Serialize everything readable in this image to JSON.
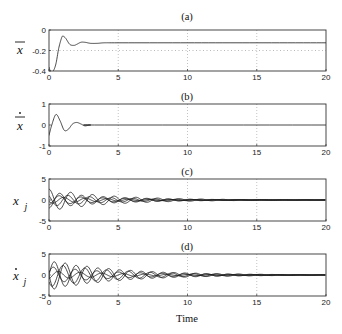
{
  "chart_data": [
    {
      "type": "line",
      "panel": "a",
      "title": "(a)",
      "ylabel": "x̄",
      "xlabel": "",
      "xlim": [
        0,
        20
      ],
      "ylim": [
        -0.4,
        0
      ],
      "xticks": [
        0,
        5,
        10,
        15,
        20
      ],
      "yticks": [
        0,
        -0.2,
        -0.4
      ],
      "ytick_labels": [
        "0",
        "-0.2",
        "-0.4"
      ],
      "grid": "vertical dotted at 5,10,15",
      "reference_line": {
        "y": -0.2,
        "style": "dotted"
      },
      "series": [
        {
          "name": "x_bar",
          "x": [
            0,
            0.1,
            0.3,
            0.5,
            0.7,
            0.9,
            1.0,
            1.2,
            1.5,
            1.8,
            2.0,
            2.3,
            2.6,
            3.0,
            3.5,
            4.0,
            5,
            10,
            15,
            20
          ],
          "y": [
            -0.36,
            -0.4,
            -0.4,
            -0.33,
            -0.18,
            -0.08,
            -0.06,
            -0.08,
            -0.14,
            -0.15,
            -0.14,
            -0.12,
            -0.12,
            -0.13,
            -0.13,
            -0.125,
            -0.125,
            -0.125,
            -0.125,
            -0.125
          ]
        }
      ]
    },
    {
      "type": "line",
      "panel": "b",
      "title": "(b)",
      "ylabel": "ẋ̄",
      "xlabel": "",
      "xlim": [
        0,
        20
      ],
      "ylim": [
        -1,
        1
      ],
      "xticks": [
        0,
        5,
        10,
        15,
        20
      ],
      "yticks": [
        1,
        0,
        -1
      ],
      "ytick_labels": [
        "1",
        "0",
        "-1"
      ],
      "grid": "vertical dotted at 5,10,15",
      "series": [
        {
          "name": "x_bar_dot",
          "x": [
            0,
            0.2,
            0.5,
            0.8,
            1.1,
            1.4,
            1.7,
            2.0,
            2.3,
            2.6,
            3.0,
            4.0,
            20
          ],
          "y": [
            -0.5,
            0.0,
            0.5,
            0.2,
            -0.25,
            -0.2,
            0.05,
            0.12,
            0.05,
            -0.04,
            0.0,
            0.0,
            0.0
          ]
        }
      ]
    },
    {
      "type": "line",
      "panel": "c",
      "title": "(c)",
      "ylabel": "x_j",
      "xlabel": "",
      "xlim": [
        0,
        20
      ],
      "ylim": [
        -5,
        5
      ],
      "xticks": [
        0,
        5,
        10,
        15,
        20
      ],
      "yticks": [
        5,
        0,
        -5
      ],
      "ytick_labels": [
        "5",
        "0",
        "-5"
      ],
      "grid": "vertical dotted at 5,10,15",
      "series_description": "five damped oscillating trajectories, initial values approx 2.5, 1.2, 0, -1, -1.8, decaying toward 0 by t≈15",
      "series": [
        {
          "name": "x_1",
          "amp": 2.6,
          "phase": 0.0,
          "omega": 4.0,
          "decay": 0.22
        },
        {
          "name": "x_2",
          "amp": 1.5,
          "phase": 0.8,
          "omega": 4.0,
          "decay": 0.22
        },
        {
          "name": "x_3",
          "amp": 0.8,
          "phase": 2.0,
          "omega": 4.0,
          "decay": 0.22
        },
        {
          "name": "x_4",
          "amp": 1.2,
          "phase": 3.3,
          "omega": 4.0,
          "decay": 0.22
        },
        {
          "name": "x_5",
          "amp": 1.9,
          "phase": 3.14,
          "omega": 4.0,
          "decay": 0.22
        }
      ]
    },
    {
      "type": "line",
      "panel": "d",
      "title": "(d)",
      "ylabel": "ẋ_j",
      "xlabel": "Time",
      "xlim": [
        0,
        20
      ],
      "ylim": [
        -5,
        5
      ],
      "xticks": [
        0,
        5,
        10,
        15,
        20
      ],
      "yticks": [
        5,
        0,
        -5
      ],
      "ytick_labels": [
        "5",
        "0",
        "-5"
      ],
      "grid": "vertical dotted at 5,10,15",
      "series_description": "five damped oscillating velocity trajectories, peak magnitude approx 3.5 near t≈0.7, decaying toward 0 by t≈16",
      "series": [
        {
          "name": "xdot_1",
          "amp": 3.6,
          "phase": 1.57,
          "omega": 4.0,
          "decay": 0.2
        },
        {
          "name": "xdot_2",
          "amp": 2.8,
          "phase": 2.2,
          "omega": 4.0,
          "decay": 0.2
        },
        {
          "name": "xdot_3",
          "amp": 1.0,
          "phase": 3.6,
          "omega": 4.0,
          "decay": 0.2
        },
        {
          "name": "xdot_4",
          "amp": 2.0,
          "phase": 5.0,
          "omega": 4.0,
          "decay": 0.2
        },
        {
          "name": "xdot_5",
          "amp": 3.4,
          "phase": 4.71,
          "omega": 4.0,
          "decay": 0.2
        }
      ]
    }
  ],
  "labels": {
    "panel_a_title": "(a)",
    "panel_b_title": "(b)",
    "panel_c_title": "(c)",
    "panel_d_title": "(d)",
    "xlabel": "Time"
  },
  "colors": {
    "line": "#1a1a1a",
    "frame": "#333333",
    "grid": "#9a9a9a",
    "background": "#ffffff"
  }
}
